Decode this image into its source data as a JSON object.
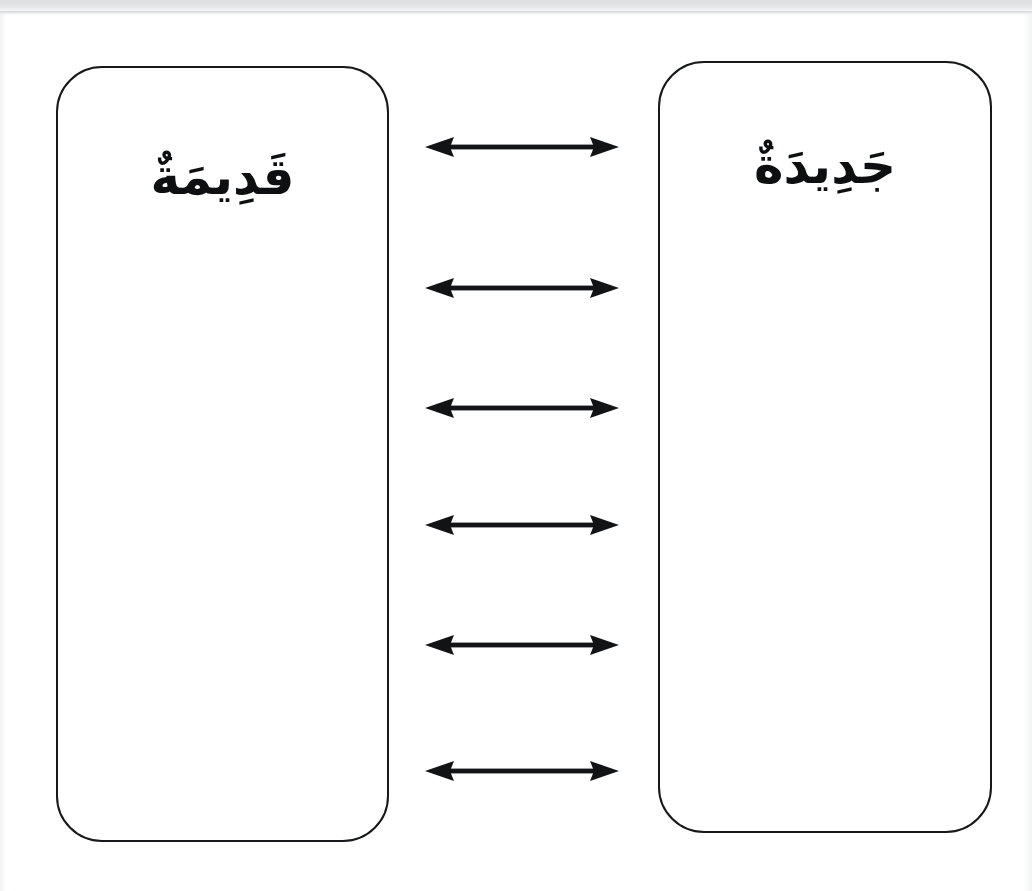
{
  "page": {
    "background_color": "#ffffff",
    "ink_color": "#16181a",
    "width": 1032,
    "height": 891,
    "scan_band_color": "#dcdee0"
  },
  "boxes": {
    "left": {
      "label": "قَدِيمَةٌ",
      "transliteration": "qadimatun",
      "meaning": "old",
      "border_color": "#16181a",
      "fill_color": "#ffffff"
    },
    "right": {
      "label": "جَدِيدَةٌ",
      "transliteration": "jadidatun",
      "meaning": "new",
      "border_color": "#16181a",
      "fill_color": "#ffffff"
    }
  },
  "connectors": {
    "icon": "double-headed-arrow-icon",
    "color": "#111315",
    "count": 6,
    "rows": [
      {
        "id": "arrow-1",
        "y": 147
      },
      {
        "id": "arrow-2",
        "y": 288
      },
      {
        "id": "arrow-3",
        "y": 408
      },
      {
        "id": "arrow-4",
        "y": 525
      },
      {
        "id": "arrow-5",
        "y": 645
      },
      {
        "id": "arrow-6",
        "y": 771
      }
    ]
  }
}
